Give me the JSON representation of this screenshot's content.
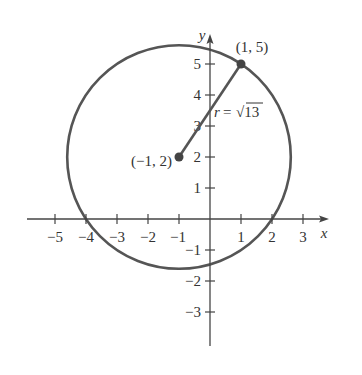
{
  "diagram": {
    "colors": {
      "axis": "#444444",
      "circle": "#555555",
      "point": "#444444",
      "text": "#333333",
      "background": "#ffffff"
    },
    "axes": {
      "x_label": "x",
      "y_label": "y",
      "x_ticks": [
        {
          "value": -5,
          "label": "−5"
        },
        {
          "value": -4,
          "label": "−4"
        },
        {
          "value": -3,
          "label": "−3"
        },
        {
          "value": -2,
          "label": "−2"
        },
        {
          "value": -1,
          "label": "−1"
        },
        {
          "value": 1,
          "label": "1"
        },
        {
          "value": 2,
          "label": "2"
        },
        {
          "value": 3,
          "label": "3"
        }
      ],
      "y_ticks": [
        {
          "value": 5,
          "label": "5"
        },
        {
          "value": 4,
          "label": "4"
        },
        {
          "value": 3,
          "label": "3"
        },
        {
          "value": 2,
          "label": "2"
        },
        {
          "value": 1,
          "label": "1"
        },
        {
          "value": -1,
          "label": "−1"
        },
        {
          "value": -2,
          "label": "−2"
        },
        {
          "value": -3,
          "label": "−3"
        }
      ]
    },
    "circle": {
      "center": {
        "x": -1,
        "y": 2
      },
      "radius_expr": "√13",
      "radius_value": 3.6056
    },
    "points": {
      "center": {
        "x": -1,
        "y": 2,
        "label": "(−1, 2)"
      },
      "on_circle": {
        "x": 1,
        "y": 5,
        "label": "(1, 5)"
      }
    },
    "radius_label": {
      "prefix": "r",
      "equals": "=",
      "value": "√13"
    }
  }
}
